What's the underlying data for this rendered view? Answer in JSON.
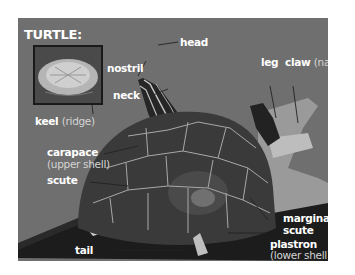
{
  "title": "TURTLE:",
  "colors": {
    "background": "#6f6f6f",
    "label": "#ffffff",
    "sublabel": "#d4d4d4",
    "shell": "#3a3a3a",
    "scute_lines": "#a8a8a8"
  },
  "inset": {
    "label": "keel",
    "sublabel": "(ridge)"
  },
  "labels": {
    "head": "head",
    "nostril": "nostril",
    "neck": "neck",
    "leg": "leg",
    "claw": "claw",
    "claw_sub": "(nail)",
    "carapace": "carapace",
    "carapace_sub": "(upper shell)",
    "scute": "scute",
    "marginal_scute_1": "marginal",
    "marginal_scute_2": "scute",
    "plastron": "plastron",
    "plastron_sub": "(lower shell)",
    "tail": "tail"
  }
}
